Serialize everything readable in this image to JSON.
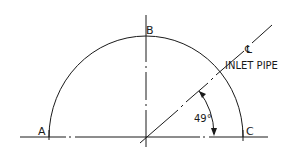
{
  "diagram": {
    "type": "engineering-drawing",
    "points": [
      {
        "id": "A",
        "label": "A"
      },
      {
        "id": "B",
        "label": "B"
      },
      {
        "id": "C",
        "label": "C"
      }
    ],
    "centerline_symbol": "℄",
    "inlet_label": "INLET PIPE",
    "angle_label": "49°",
    "angle_degrees": 49,
    "colors": {
      "line": "#1a1a1a",
      "background": "#ffffff"
    }
  }
}
